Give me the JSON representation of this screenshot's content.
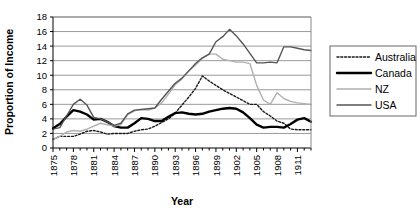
{
  "chart_data": {
    "type": "line",
    "title": "",
    "xlabel": "Year",
    "ylabel": "Proportion of Income",
    "xlim": [
      1875,
      1913
    ],
    "ylim": [
      0,
      18
    ],
    "ytick_step": 2,
    "grid": "horizontal",
    "legend_position": "right-outside",
    "x": [
      1875,
      1876,
      1877,
      1878,
      1879,
      1880,
      1881,
      1882,
      1883,
      1884,
      1885,
      1886,
      1887,
      1888,
      1889,
      1890,
      1891,
      1892,
      1893,
      1894,
      1895,
      1896,
      1897,
      1898,
      1899,
      1900,
      1901,
      1902,
      1903,
      1904,
      1905,
      1906,
      1907,
      1908,
      1909,
      1910,
      1911,
      1912,
      1913
    ],
    "xtick_labels": [
      "1875",
      "1878",
      "1881",
      "1884",
      "1887",
      "1890",
      "1893",
      "1896",
      "1899",
      "1902",
      "1905",
      "1908",
      "1911"
    ],
    "ytick_labels": [
      "0",
      "2",
      "4",
      "6",
      "8",
      "10",
      "12",
      "14",
      "16",
      "18"
    ],
    "series": [
      {
        "name": "Australia",
        "style": "dotted",
        "color": "#1a1a1a",
        "width": 1.4,
        "values": [
          1.2,
          1.6,
          1.6,
          1.6,
          1.9,
          2.3,
          2.4,
          2.2,
          1.9,
          2.0,
          2.0,
          2.0,
          2.3,
          2.5,
          2.6,
          3.0,
          3.5,
          4.0,
          4.8,
          5.9,
          7.0,
          8.2,
          9.9,
          9.2,
          8.6,
          8.0,
          7.5,
          7.0,
          6.5,
          6.0,
          6.0,
          5.0,
          4.4,
          3.7,
          3.4,
          2.6,
          2.5,
          2.5,
          2.5
        ]
      },
      {
        "name": "Canada",
        "style": "solid",
        "color": "#000000",
        "width": 2.4,
        "values": [
          2.7,
          3.3,
          4.3,
          5.2,
          5.0,
          4.6,
          3.9,
          4.0,
          3.6,
          3.0,
          2.8,
          2.8,
          3.4,
          4.1,
          4.0,
          3.7,
          3.7,
          4.3,
          4.8,
          4.9,
          4.7,
          4.6,
          4.7,
          5.0,
          5.2,
          5.4,
          5.5,
          5.4,
          4.9,
          4.1,
          3.2,
          2.8,
          2.9,
          2.9,
          2.8,
          3.3,
          3.9,
          4.1,
          3.6
        ]
      },
      {
        "name": "NZ",
        "style": "solid",
        "color": "#b0b0b0",
        "width": 1.4,
        "values": [
          1.2,
          1.6,
          2.2,
          2.4,
          2.3,
          2.6,
          3.0,
          3.4,
          3.2,
          3.0,
          3.2,
          4.6,
          5.1,
          5.3,
          5.2,
          5.5,
          6.2,
          7.4,
          8.7,
          9.5,
          10.6,
          11.4,
          12.3,
          12.9,
          12.9,
          12.2,
          12.0,
          11.8,
          11.8,
          11.6,
          8.6,
          6.6,
          6.0,
          7.6,
          6.8,
          6.4,
          6.2,
          6.1,
          6.0
        ]
      },
      {
        "name": "USA",
        "style": "solid",
        "color": "#555555",
        "width": 1.4,
        "values": [
          2.6,
          2.8,
          4.4,
          6.0,
          6.7,
          5.9,
          4.2,
          4.0,
          3.6,
          3.1,
          3.4,
          4.7,
          5.2,
          5.3,
          5.4,
          5.5,
          6.7,
          7.8,
          8.9,
          9.6,
          10.6,
          11.6,
          12.4,
          12.9,
          14.6,
          15.3,
          16.3,
          15.4,
          14.3,
          13.0,
          11.7,
          11.7,
          11.8,
          11.7,
          13.9,
          13.9,
          13.7,
          13.5,
          13.4
        ]
      }
    ]
  },
  "legend": {
    "items": [
      {
        "label": "Australia"
      },
      {
        "label": "Canada"
      },
      {
        "label": "NZ"
      },
      {
        "label": "USA"
      }
    ]
  }
}
